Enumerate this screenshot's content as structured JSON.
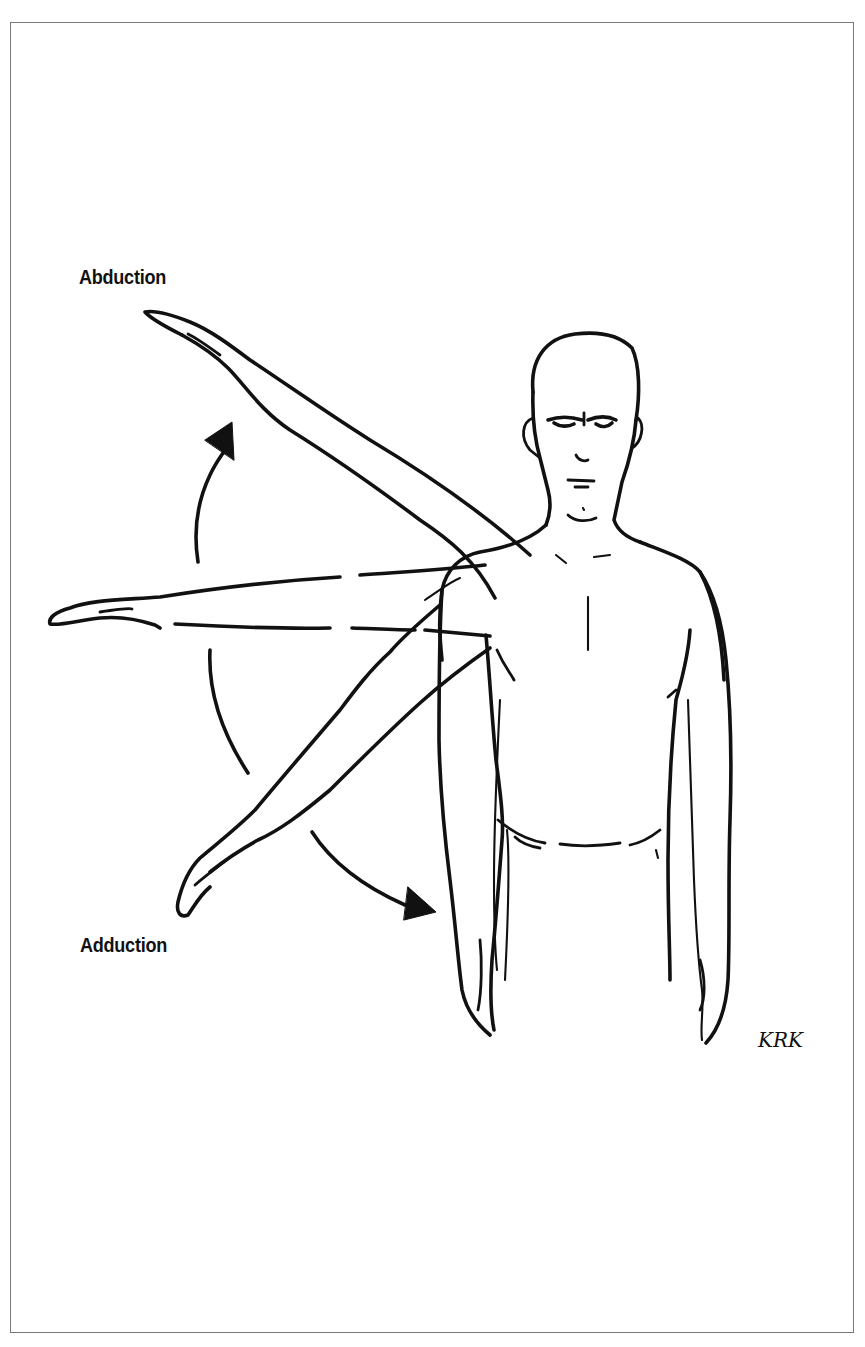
{
  "figure": {
    "labels": {
      "abduction": "Abduction",
      "adduction": "Adduction"
    },
    "signature": "KRK",
    "arrows": [
      {
        "name": "abduction-arrow",
        "direction": "up"
      },
      {
        "name": "adduction-arrow",
        "direction": "down-right"
      }
    ],
    "arm_positions": [
      "raised-overhead-diagonal",
      "horizontal-shoulder-level",
      "lowered-diagonal",
      "at-side"
    ],
    "colors": {
      "ink": "#111111",
      "frame": "#7a7a7a",
      "background": "#ffffff"
    }
  }
}
